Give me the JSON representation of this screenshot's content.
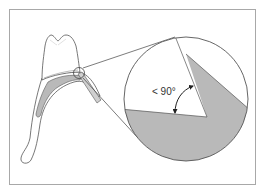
{
  "diagram": {
    "type": "dental-illustration",
    "angle_label": "< 90°",
    "colors": {
      "background": "#ffffff",
      "frame": "#a8a8a8",
      "outline": "#555555",
      "shade": "#b9b9b9",
      "text": "#333333"
    }
  }
}
